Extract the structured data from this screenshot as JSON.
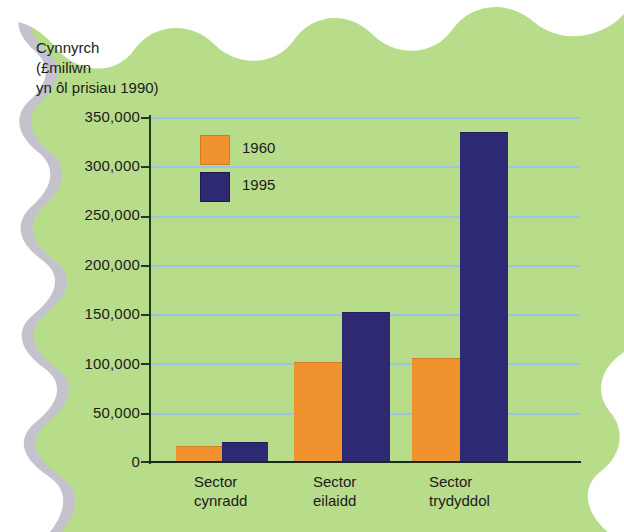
{
  "figure": {
    "axis_title_lines": "Cynnyrch\n(£miliwn\nyn ôl prisiau 1990)",
    "background_color": "#b8dd8a",
    "gridline_color": "#9cc4e4",
    "axis_color": "#1d3b1f"
  },
  "legend": {
    "items": [
      {
        "label": "1960",
        "color": "#f0922e"
      },
      {
        "label": "1995",
        "color": "#2d2a73"
      }
    ]
  },
  "yaxis": {
    "ticks": [
      "350,000",
      "300,000",
      "250,000",
      "200,000",
      "150,000",
      "100,000",
      "50,000",
      "0"
    ]
  },
  "xaxis": {
    "categories": [
      {
        "line1": "Sector",
        "line2": "cynradd"
      },
      {
        "line1": "Sector",
        "line2": "eilaidd"
      },
      {
        "line1": "Sector",
        "line2": "trydyddol"
      }
    ]
  },
  "chart_data": {
    "type": "bar",
    "title": "Cynnyrch (£miliwn yn ôl prisiau 1990)",
    "xlabel": "",
    "ylabel": "Cynnyrch (£miliwn yn ôl prisiau 1990)",
    "categories": [
      "Sector cynradd",
      "Sector eilaidd",
      "Sector trydyddol"
    ],
    "series": [
      {
        "name": "1960",
        "color": "#f0922e",
        "values": [
          15000,
          100000,
          105000
        ]
      },
      {
        "name": "1995",
        "color": "#2d2a73",
        "values": [
          19000,
          151000,
          334000
        ]
      }
    ],
    "ylim": [
      0,
      350000
    ],
    "ytick_step": 50000,
    "yticks": [
      0,
      50000,
      100000,
      150000,
      200000,
      250000,
      300000,
      350000
    ],
    "grid": true,
    "legend_position": "inside-top-left"
  }
}
